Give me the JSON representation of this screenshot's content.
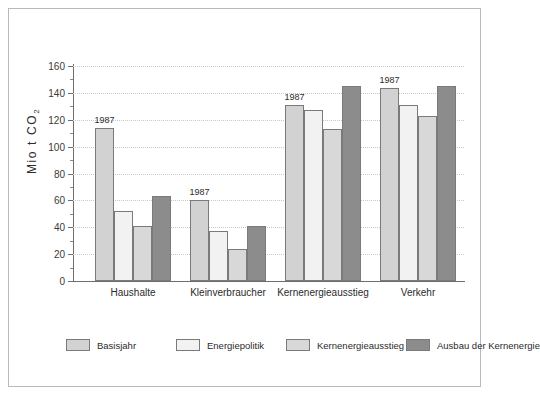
{
  "chart_data": {
    "type": "bar",
    "title": "",
    "xlabel": "",
    "ylabel": "Mio t CO",
    "ylabel_sub": "2",
    "ylim": [
      0,
      160
    ],
    "ytick_step": 20,
    "yticks": [
      "0",
      "20",
      "40",
      "60",
      "80",
      "100",
      "120",
      "140",
      "160"
    ],
    "grid": true,
    "legend_position": "bottom",
    "categories": [
      "Haushalte",
      "Kleinverbraucher",
      "Kernenergieausstieg",
      "Verkehr"
    ],
    "series": [
      {
        "name": "Basisjahr",
        "color": "#d2d2d2",
        "values": [
          114,
          60,
          131,
          144
        ]
      },
      {
        "name": "Energiepolitik",
        "color": "#f2f2f2",
        "values": [
          52,
          37,
          127,
          131
        ]
      },
      {
        "name": "Kernenergieausstieg",
        "color": "#d8d8d8",
        "values": [
          41,
          24,
          113,
          123
        ]
      },
      {
        "name": "Ausbau der Kernenergie",
        "color": "#8c8c8c",
        "values": [
          63,
          41,
          145,
          145
        ]
      }
    ],
    "annotations": [
      {
        "text": "1987",
        "category": "Haushalte",
        "series": "Basisjahr"
      },
      {
        "text": "1987",
        "category": "Kleinverbraucher",
        "series": "Basisjahr"
      },
      {
        "text": "1987",
        "category": "Kernenergieausstieg",
        "series": "Basisjahr"
      },
      {
        "text": "1987",
        "category": "Verkehr",
        "series": "Basisjahr"
      }
    ]
  }
}
